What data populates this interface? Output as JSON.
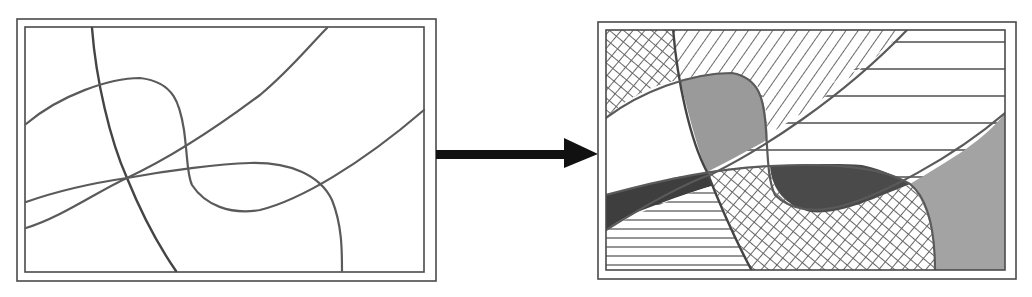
{
  "diagram": {
    "left_panel": {
      "label": "",
      "content": "intersecting curved lines"
    },
    "arrow": {
      "direction": "right",
      "color": "#111111"
    },
    "right_panel": {
      "label": "",
      "content": "regions filled with hatching, cross-hatching, and shading"
    },
    "colors": {
      "frame": "#4a4a4a",
      "line": "#5a5a5a",
      "dark_fill": "#3e3e3e",
      "mid_fill": "#8c8c8c",
      "light_fill": "#a8a8a8"
    }
  }
}
